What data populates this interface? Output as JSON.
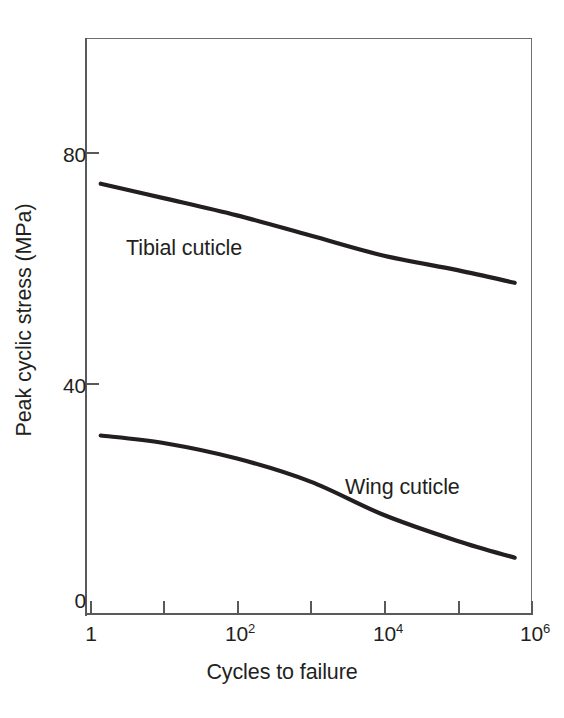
{
  "chart_data": {
    "type": "line",
    "title": "",
    "subtitle": "",
    "xlabel": "Cycles to failure",
    "ylabel": "Peak cyclic stress (MPa)",
    "xscale": "log",
    "yscale": "linear",
    "xlim": [
      1,
      1000000
    ],
    "ylim": [
      0,
      103
    ],
    "ytick_values": [
      0,
      40,
      80
    ],
    "ytick_labels": [
      "0",
      "40",
      "80"
    ],
    "xtick_values": [
      1,
      10,
      100,
      1000,
      10000,
      100000,
      1000000
    ],
    "xtick_labels": [
      "1",
      "",
      "10²",
      "",
      "10⁴",
      "",
      "10⁶"
    ],
    "xtick_labels_html": [
      {
        "base": "1",
        "exp": ""
      },
      {
        "base": "",
        "exp": ""
      },
      {
        "base": "10",
        "exp": "2"
      },
      {
        "base": "",
        "exp": ""
      },
      {
        "base": "10",
        "exp": "4"
      },
      {
        "base": "",
        "exp": ""
      },
      {
        "base": "10",
        "exp": "6"
      }
    ],
    "grid": false,
    "legend": "inline-annotations",
    "line_color": "#231f20",
    "axis_color": "#58595b",
    "frame_color": "#6d6e71",
    "background": "#ffffff",
    "series": [
      {
        "name": "Tibial cuticle",
        "label_x_cycles": 30,
        "label_y_mpa": 62,
        "points": [
          {
            "x": 1.4,
            "y": 74.5
          },
          {
            "x": 10,
            "y": 72.0
          },
          {
            "x": 100,
            "y": 69.0
          },
          {
            "x": 1000,
            "y": 65.5
          },
          {
            "x": 10000,
            "y": 62.0
          },
          {
            "x": 100000,
            "y": 59.5
          },
          {
            "x": 600000,
            "y": 57.3
          }
        ]
      },
      {
        "name": "Wing cuticle",
        "label_x_cycles": 30000,
        "label_y_mpa": 23.5,
        "points": [
          {
            "x": 1.4,
            "y": 30.8
          },
          {
            "x": 10,
            "y": 29.5
          },
          {
            "x": 100,
            "y": 26.8
          },
          {
            "x": 1000,
            "y": 22.8
          },
          {
            "x": 10000,
            "y": 17.0
          },
          {
            "x": 100000,
            "y": 12.5
          },
          {
            "x": 600000,
            "y": 9.6
          }
        ]
      }
    ]
  },
  "figure": {
    "y_axis_title": "Peak cyclic stress (MPa)",
    "x_axis_title": "Cycles to failure",
    "series_labels": {
      "tibial": "Tibial cuticle",
      "wing": "Wing cuticle"
    },
    "y_ticks": [
      {
        "label": "80",
        "top": 143
      },
      {
        "label": "40",
        "top": 374
      },
      {
        "label": "0",
        "top": 589
      }
    ],
    "x_ticks": [
      {
        "base": "1",
        "exp": "",
        "left": 90
      },
      {
        "base": "",
        "exp": "",
        "left": 163
      },
      {
        "base": "10",
        "exp": "2",
        "left": 237
      },
      {
        "base": "",
        "exp": "",
        "left": 310
      },
      {
        "base": "10",
        "exp": "4",
        "left": 384
      },
      {
        "base": "",
        "exp": "",
        "left": 458
      },
      {
        "base": "10",
        "exp": "6",
        "left": 532
      }
    ]
  }
}
